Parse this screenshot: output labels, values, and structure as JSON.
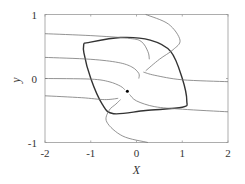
{
  "chart_data": {
    "type": "line",
    "title": "",
    "subtitle": "Phase portrait with stable limit cycle",
    "xlabel": "X",
    "ylabel": "y",
    "xlim": [
      -2,
      2
    ],
    "ylim": [
      -1,
      1
    ],
    "x_ticks": [
      "-2",
      "-1",
      "0",
      "1",
      "2"
    ],
    "y_ticks": [
      "-1",
      "0",
      "1"
    ],
    "grid": false,
    "legend": null,
    "fixed_point": {
      "x": -0.2,
      "y": -0.2
    },
    "series": [
      {
        "name": "limit cycle",
        "style": "thick",
        "points": [
          [
            -1.15,
            0.55
          ],
          [
            -0.35,
            0.64
          ],
          [
            0.3,
            0.6
          ],
          [
            0.75,
            0.42
          ],
          [
            1.0,
            0.0
          ],
          [
            1.1,
            -0.35
          ],
          [
            1.0,
            -0.45
          ],
          [
            0.2,
            -0.5
          ],
          [
            -0.5,
            -0.55
          ],
          [
            -0.75,
            -0.4
          ],
          [
            -1.0,
            0.0
          ],
          [
            -1.15,
            0.4
          ],
          [
            -1.15,
            0.55
          ]
        ]
      },
      {
        "name": "trajectory 1",
        "style": "thin",
        "points": [
          [
            -2,
            0.7
          ],
          [
            -1,
            0.67
          ],
          [
            -0.2,
            0.63
          ],
          [
            0.1,
            0.58
          ],
          [
            0.25,
            0.42
          ],
          [
            0.28,
            0.3
          ]
        ]
      },
      {
        "name": "trajectory 2",
        "style": "thin",
        "points": [
          [
            -2,
            0.33
          ],
          [
            -1,
            0.3
          ],
          [
            -0.4,
            0.25
          ],
          [
            -0.1,
            0.18
          ],
          [
            0.05,
            0.08
          ],
          [
            0.05,
            0.0
          ]
        ]
      },
      {
        "name": "trajectory 3",
        "style": "thin",
        "points": [
          [
            -2,
            0.0
          ],
          [
            -1,
            -0.01
          ],
          [
            -0.6,
            -0.05
          ],
          [
            -0.35,
            -0.12
          ],
          [
            -0.25,
            -0.18
          ]
        ]
      },
      {
        "name": "trajectory 4",
        "style": "thin",
        "points": [
          [
            -2,
            -0.27
          ],
          [
            -1.2,
            -0.3
          ],
          [
            -0.7,
            -0.33
          ],
          [
            -0.4,
            -0.31
          ]
        ]
      },
      {
        "name": "trajectory 5",
        "style": "thin",
        "points": [
          [
            0.2,
            1.0
          ],
          [
            0.7,
            0.85
          ],
          [
            0.95,
            0.6
          ],
          [
            0.8,
            0.45
          ],
          [
            0.5,
            0.3
          ],
          [
            0.2,
            0.12
          ]
        ]
      },
      {
        "name": "trajectory 6",
        "style": "thin",
        "points": [
          [
            2,
            -0.05
          ],
          [
            1.0,
            -0.02
          ],
          [
            0.4,
            0.05
          ],
          [
            0.15,
            0.1
          ]
        ]
      },
      {
        "name": "trajectory 7",
        "style": "thin",
        "points": [
          [
            2,
            -0.52
          ],
          [
            1.0,
            -0.48
          ],
          [
            0.4,
            -0.44
          ],
          [
            0.0,
            -0.35
          ],
          [
            -0.15,
            -0.25
          ]
        ]
      },
      {
        "name": "trajectory 8",
        "style": "thin",
        "points": [
          [
            0.25,
            -1.0
          ],
          [
            -0.3,
            -0.9
          ],
          [
            -0.65,
            -0.68
          ],
          [
            -0.6,
            -0.5
          ],
          [
            -0.45,
            -0.4
          ],
          [
            -0.35,
            -0.33
          ]
        ]
      }
    ]
  }
}
